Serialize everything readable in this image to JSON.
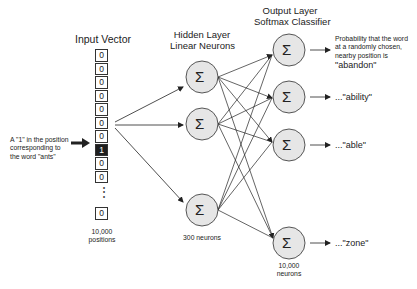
{
  "input": {
    "title": "Input Vector",
    "cells": [
      "0",
      "0",
      "0",
      "0",
      "0",
      "0",
      "0",
      "1",
      "0",
      "0"
    ],
    "ellipsis": "⋮",
    "last_cell": "0",
    "count_label_line1": "10,000",
    "count_label_line2": "positions",
    "annotation_line1": "A \"1\" in the position",
    "annotation_line2": "corresponding to",
    "annotation_line3": "the word \"ants\""
  },
  "hidden": {
    "title_line1": "Hidden Layer",
    "title_line2": "Linear Neurons",
    "node_symbol": "Σ",
    "count_label": "300 neurons"
  },
  "output": {
    "title_line1": "Output Layer",
    "title_line2": "Softmax Classifier",
    "node_symbol": "Σ",
    "count_label_line1": "10,000",
    "count_label_line2": "neurons",
    "first_desc_line1": "Probability that the word",
    "first_desc_line2": "at a randomly chosen,",
    "first_desc_line3": "nearby position is",
    "words": [
      "\"abandon\"",
      "...\"ability\"",
      "...\"able\"",
      "...\"zone\""
    ]
  },
  "colors": {
    "node_fill": "#e6e6e6",
    "node_stroke": "#444444",
    "line": "#222222",
    "active_cell": "#1f1f1f"
  }
}
